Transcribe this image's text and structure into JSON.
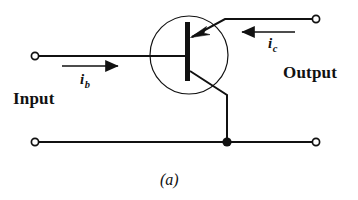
{
  "figure": {
    "caption": "(a)",
    "type": "transistor-circuit-schematic",
    "ink_color": "#111111",
    "background_color": "#ffffff"
  },
  "labels": {
    "input": "Input",
    "output": "Output",
    "base_current_symbol": "i",
    "base_current_subscript": "b",
    "collector_current_symbol": "i",
    "collector_current_subscript": "c"
  },
  "components": {
    "transistor": {
      "name": "bipolar-junction-transistor",
      "envelope": "circle",
      "arrow_direction": "into-base",
      "terminals": [
        "base",
        "collector",
        "emitter"
      ]
    },
    "terminals": [
      {
        "name": "input-top-terminal",
        "style": "open-circle"
      },
      {
        "name": "input-bottom-terminal",
        "style": "open-circle"
      },
      {
        "name": "output-top-terminal",
        "style": "open-circle"
      },
      {
        "name": "output-bottom-terminal",
        "style": "open-circle"
      }
    ],
    "junction": {
      "name": "emitter-ground-junction",
      "style": "filled-dot"
    },
    "current_arrows": [
      {
        "name": "base-current-arrow",
        "direction": "right"
      },
      {
        "name": "collector-current-arrow",
        "direction": "left"
      }
    ]
  }
}
